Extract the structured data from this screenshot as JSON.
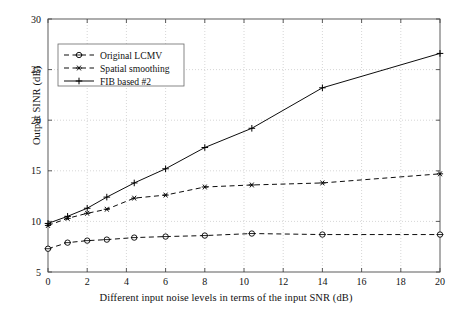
{
  "chart_data": {
    "type": "line",
    "title": "",
    "xlabel": "Different input noise levels in terms of the input SNR (dB)",
    "ylabel": "Output SINR (dB)",
    "xlim": [
      0,
      20
    ],
    "ylim": [
      5,
      30
    ],
    "xticks": [
      0,
      2,
      4,
      6,
      8,
      10,
      12,
      14,
      16,
      18,
      20
    ],
    "xticklabels": [
      "0",
      "2",
      "4",
      "6",
      "8",
      "10",
      "12",
      "14",
      "16",
      "18",
      "20"
    ],
    "yticks": [
      5,
      10,
      15,
      20,
      25,
      30
    ],
    "yticklabels": [
      "5",
      "10",
      "15",
      "20",
      "25",
      "30"
    ],
    "grid": true,
    "grid_style": "dotted",
    "legend_position": "upper left",
    "x": [
      0,
      1,
      2,
      3,
      4.4,
      6,
      8,
      10.4,
      14,
      20
    ],
    "series": [
      {
        "name": "Original LCMV",
        "marker": "circle",
        "linestyle": "dashed",
        "color": "#000000",
        "values": [
          7.3,
          7.9,
          8.1,
          8.2,
          8.4,
          8.5,
          8.6,
          8.8,
          8.7,
          8.7
        ]
      },
      {
        "name": "Spatial smoothing",
        "marker": "asterisk",
        "linestyle": "dashed",
        "color": "#000000",
        "values": [
          9.6,
          10.3,
          10.8,
          11.2,
          12.3,
          12.6,
          13.4,
          13.6,
          13.8,
          14.7
        ]
      },
      {
        "name": "FIB based #2",
        "marker": "plus",
        "linestyle": "solid",
        "color": "#000000",
        "values": [
          9.8,
          10.5,
          11.3,
          12.4,
          13.8,
          15.2,
          17.3,
          19.2,
          23.2,
          26.6
        ]
      }
    ]
  },
  "legend": {
    "entries": [
      {
        "label": "Original LCMV"
      },
      {
        "label": "Spatial smoothing"
      },
      {
        "label": "FIB based #2"
      }
    ]
  }
}
